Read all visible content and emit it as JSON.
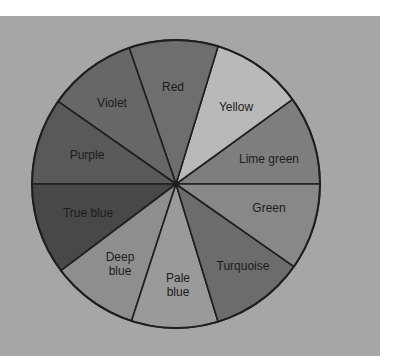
{
  "diagram": {
    "type": "color-wheel",
    "center": [
      176,
      184
    ],
    "radius": 144,
    "background_color": "#a6a6a6",
    "segments": [
      {
        "name": "Lime green",
        "lines": [
          "Lime green"
        ],
        "start_angle": 0,
        "end_angle": 36,
        "fill": "#7e7e7e"
      },
      {
        "name": "Yellow",
        "lines": [
          "Yellow"
        ],
        "start_angle": 36,
        "end_angle": 73,
        "fill": "#b9b9b9"
      },
      {
        "name": "Red",
        "lines": [
          "Red"
        ],
        "start_angle": 73,
        "end_angle": 109,
        "fill": "#6e6e6e"
      },
      {
        "name": "Violet",
        "lines": [
          "Violet"
        ],
        "start_angle": 109,
        "end_angle": 145,
        "fill": "#676767"
      },
      {
        "name": "Purple",
        "lines": [
          "Purple"
        ],
        "start_angle": 145,
        "end_angle": 180,
        "fill": "#595959"
      },
      {
        "name": "True blue",
        "lines": [
          "True blue"
        ],
        "start_angle": 180,
        "end_angle": 217,
        "fill": "#484848"
      },
      {
        "name": "Deep blue",
        "lines": [
          "Deep",
          "blue"
        ],
        "start_angle": 217,
        "end_angle": 252,
        "fill": "#8e8e8e"
      },
      {
        "name": "Pale blue",
        "lines": [
          "Pale",
          "blue"
        ],
        "start_angle": 252,
        "end_angle": 287,
        "fill": "#9a9a9a"
      },
      {
        "name": "Turquoise",
        "lines": [
          "Turquoise"
        ],
        "start_angle": 287,
        "end_angle": 325,
        "fill": "#6c6c6c"
      },
      {
        "name": "Green",
        "lines": [
          "Green"
        ],
        "start_angle": 325,
        "end_angle": 360,
        "fill": "#888888"
      }
    ],
    "labels": {
      "lime_green": "Lime green",
      "yellow": "Yellow",
      "red": "Red",
      "violet": "Violet",
      "purple": "Purple",
      "true_blue": "True blue",
      "deep_blue_1": "Deep",
      "deep_blue_2": "blue",
      "pale_blue_1": "Pale",
      "pale_blue_2": "blue",
      "turquoise": "Turquoise",
      "green": "Green"
    }
  }
}
